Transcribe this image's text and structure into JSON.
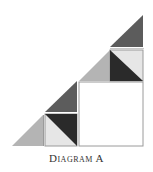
{
  "caption": "Diagram A",
  "colors": {
    "dark": "#2a2a2a",
    "mid_dark": "#5c5c5c",
    "light_gray": "#b4b4b4",
    "very_light": "#e6e6e6",
    "white": "#ffffff",
    "outline": "#9a9a9a"
  },
  "shapes": [
    {
      "name": "top-triangle",
      "type": "triangle",
      "fill": "mid_dark",
      "points": "143,15 110,47 143,47"
    },
    {
      "name": "medium-square-left-triangle",
      "type": "triangle",
      "fill": "light_gray",
      "points": "110,50 79,81 110,81"
    },
    {
      "name": "medium-square-light",
      "type": "triangle",
      "fill": "very_light",
      "points": "110,50 143,50 143,81"
    },
    {
      "name": "medium-square-dark",
      "type": "triangle",
      "fill": "dark",
      "points": "110,50 143,81 110,81"
    },
    {
      "name": "big-square",
      "type": "rect",
      "fill": "white",
      "x": 79,
      "y": 82,
      "w": 64,
      "h": 64
    },
    {
      "name": "mid-triangle",
      "type": "triangle",
      "fill": "mid_dark",
      "points": "77,81 45,112 77,112"
    },
    {
      "name": "small-square-dark",
      "type": "triangle",
      "fill": "dark",
      "points": "45,114 77,114 77,146"
    },
    {
      "name": "small-square-light",
      "type": "triangle",
      "fill": "very_light",
      "points": "45,114 77,146 45,146"
    },
    {
      "name": "left-triangle",
      "type": "triangle",
      "fill": "light_gray",
      "points": "43,115 12,146 43,146"
    }
  ]
}
